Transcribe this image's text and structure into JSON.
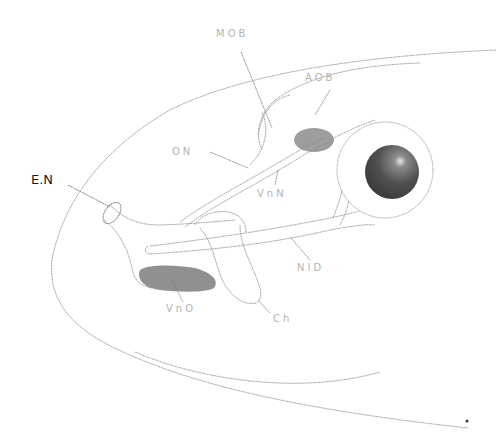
{
  "diagram": {
    "colors": {
      "outline": "#9a9a9a",
      "shaded_organ": "#7a7a7a",
      "eye_pupil": "#4a4a4a",
      "label_faint": "#b4b4b4",
      "label_dark": "#1a1a1a"
    },
    "labels": {
      "mob": "MOB",
      "aob": "AOB",
      "on": "ON",
      "vnn": "VnN",
      "en": "E.N",
      "nid": "NID",
      "vno": "VnO",
      "ch": "Ch"
    }
  }
}
